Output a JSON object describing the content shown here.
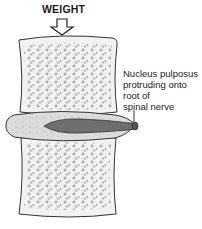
{
  "diagram": {
    "title": "WEIGHT",
    "label": "Nucleus pulposus\nprotruding onto\nroot of\nspinal nerve",
    "parts": [
      "weight-arrow",
      "upper-vertebra",
      "intervertebral-disc",
      "nucleus-pulposus",
      "spinal-nerve-root",
      "lower-vertebra"
    ],
    "colors": {
      "outline": "#333333",
      "bone_fill": "#f2f2f2",
      "disc_fill": "#dcdcdc",
      "nucleus_fill": "#6e6e6e"
    }
  }
}
